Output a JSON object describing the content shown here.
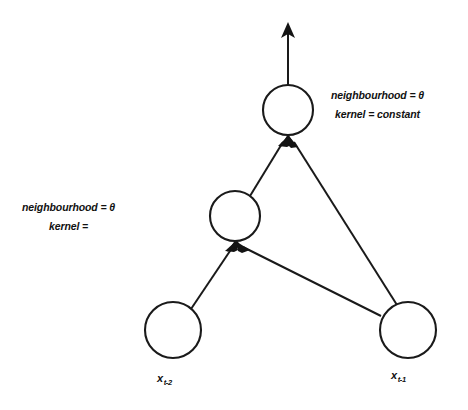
{
  "figure": {
    "type": "diagram",
    "background_color": "#ffffff",
    "stroke_color": "#1a1a1a"
  },
  "annotations": {
    "top": {
      "line1": "neighbourhood = θ",
      "line2": "kernel = constant"
    },
    "middle": {
      "line1": "neighbourhood = θ",
      "line2": "kernel ="
    }
  },
  "nodes": [
    {
      "id": "output",
      "label": "",
      "cx": 288,
      "cy": 110,
      "r": 25
    },
    {
      "id": "hidden",
      "label": "",
      "cx": 235,
      "cy": 216,
      "r": 25
    },
    {
      "id": "input-left",
      "label": "",
      "cx": 173,
      "cy": 330,
      "r": 28
    },
    {
      "id": "input-right",
      "label": "",
      "cx": 408,
      "cy": 330,
      "r": 28
    }
  ],
  "node_labels": {
    "left": {
      "base": "x",
      "sub": "t-2"
    },
    "right": {
      "base": "x",
      "sub": "t-1"
    }
  },
  "edges": [
    {
      "from": "hidden",
      "to": "output"
    },
    {
      "from": "input-right",
      "to": "output"
    },
    {
      "from": "input-left",
      "to": "hidden"
    },
    {
      "from": "input-right",
      "to": "hidden"
    },
    {
      "from": "output",
      "to": "out-arrow"
    }
  ]
}
